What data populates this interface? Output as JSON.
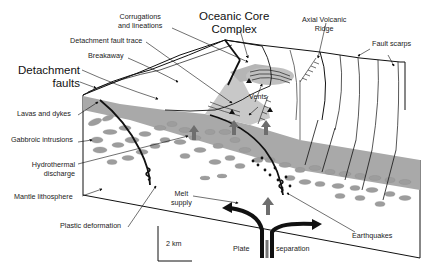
{
  "diagram": {
    "title_labels": {
      "detachment_faults": [
        "Detachment",
        "faults"
      ],
      "oceanic_core_complex": [
        "Oceanic Core",
        "Complex"
      ]
    },
    "labels": {
      "corrugations": [
        "Corrugations",
        "and lineations"
      ],
      "detachment_fault_trace": "Detachment fault trace",
      "breakaway": "Breakaway",
      "axial_volcanic_ridge": [
        "Axial Volcanic",
        "Ridge"
      ],
      "fault_scarps": "Fault scarps",
      "vents": "Vents",
      "lavas_and_dykes": "Lavas and dykes",
      "gabbroic_intrusions": "Gabbroic intrusions",
      "hydrothermal_discharge": [
        "Hydrothermal",
        "discharge"
      ],
      "mantle_lithosphere": "Mantle lithosphere",
      "melt_supply": [
        "Melt",
        "supply"
      ],
      "plastic_deformation": "Plastic deformation",
      "earthquakes": "Earthquakes",
      "plate": "Plate",
      "separation": "separation"
    },
    "scale_bar": {
      "label": "2 km"
    },
    "colors": {
      "line": "#111111",
      "fill_gray": "#a9a9a9",
      "light_gray": "#d4d4d4",
      "arrow_gray": "#6e6e6e"
    }
  }
}
